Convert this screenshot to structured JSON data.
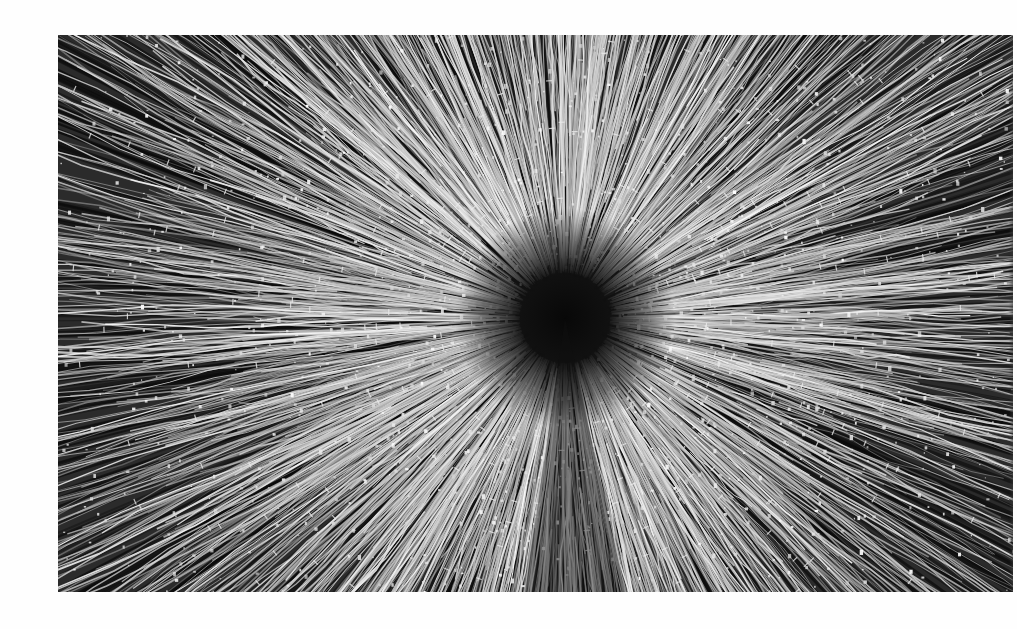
{
  "image": {
    "description": "Black-and-white photograph of radial light streaks bursting outward from a dark central point",
    "subject": "radial-light-streaks",
    "palette": {
      "background": "#fefefe",
      "dark": "#1a1a1a",
      "mid": "#5a5a5a",
      "light": "#f2f2f2"
    },
    "frame": {
      "left": 58,
      "top": 35,
      "width": 955,
      "height": 557
    },
    "burst_center": {
      "x": 565,
      "y": 318
    }
  }
}
